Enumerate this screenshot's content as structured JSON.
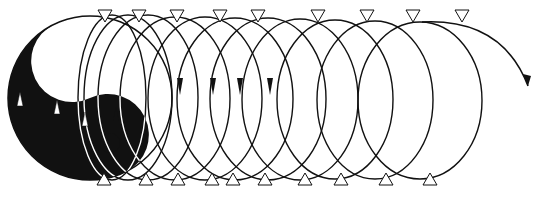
{
  "diagram": {
    "type": "yin-yang spiral helix",
    "colors": {
      "ink": "#111111",
      "paper": "#ffffff"
    },
    "yinyang": {
      "cx": 90,
      "cy": 98,
      "r": 82,
      "white_dot": {
        "cx": 93,
        "cy": 63,
        "r": 9
      },
      "black_dot": {
        "cx": 110,
        "cy": 143,
        "r": 10
      }
    },
    "loops": [
      {
        "cx": 112,
        "rx": 34,
        "top": 15,
        "bottom": 180
      },
      {
        "cx": 128,
        "rx": 44,
        "top": 15,
        "bottom": 180
      },
      {
        "cx": 148,
        "rx": 50,
        "top": 15,
        "bottom": 180
      },
      {
        "cx": 175,
        "rx": 55,
        "top": 17,
        "bottom": 180
      },
      {
        "cx": 205,
        "rx": 57,
        "top": 17,
        "bottom": 180
      },
      {
        "cx": 235,
        "rx": 58,
        "top": 18,
        "bottom": 180
      },
      {
        "cx": 268,
        "rx": 58,
        "top": 18,
        "bottom": 180
      },
      {
        "cx": 300,
        "rx": 58,
        "top": 19,
        "bottom": 180
      },
      {
        "cx": 335,
        "rx": 58,
        "top": 20,
        "bottom": 179
      },
      {
        "cx": 375,
        "rx": 58,
        "top": 21,
        "bottom": 179
      },
      {
        "cx": 420,
        "rx": 62,
        "top": 22,
        "bottom": 179
      }
    ],
    "top_markers_x": [
      105,
      139,
      177,
      220,
      258,
      318,
      367,
      413,
      462
    ],
    "bottom_markers_x": [
      104,
      146,
      178,
      212,
      233,
      265,
      305,
      341,
      386,
      430
    ],
    "down_arrows_x": [
      180,
      213,
      240,
      270
    ],
    "up_arrows": [
      {
        "x": 20,
        "y": 100
      },
      {
        "x": 57,
        "y": 108
      },
      {
        "x": 85,
        "y": 120
      },
      {
        "x": 116,
        "y": 115
      }
    ],
    "exit_arrow": {
      "from_x": 462,
      "to_x": 528,
      "to_y": 86
    }
  }
}
